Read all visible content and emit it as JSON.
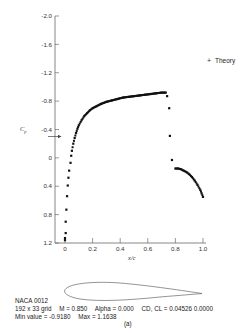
{
  "chart_data": {
    "type": "scatter",
    "title": "",
    "xlabel": "x/c",
    "ylabel": "Cp",
    "ylim": [
      1.2,
      -2.0
    ],
    "xlim": [
      0,
      1.0
    ],
    "y_inverted": true,
    "grid": false,
    "legend": {
      "position": "top-right",
      "entries": [
        {
          "marker": "+",
          "label": "Theory"
        }
      ]
    },
    "x_ticks": [
      "0",
      "0.2",
      "0.4",
      "0.6",
      "0.8",
      "1.0"
    ],
    "y_ticks": [
      "-2.0",
      "-1.6",
      "-1.2",
      "-0.8",
      "-0.4",
      "0",
      "0.4",
      "0.8",
      "1.2"
    ],
    "critical_cp_marker": {
      "value": -0.32,
      "label": "arrow on Cp axis"
    },
    "series": [
      {
        "name": "Theory",
        "marker": "square",
        "x": [
          0.0,
          0.0,
          0.005,
          0.005,
          0.01,
          0.015,
          0.02,
          0.025,
          0.03,
          0.04,
          0.045,
          0.05,
          0.06,
          0.07,
          0.08,
          0.09,
          0.1,
          0.12,
          0.14,
          0.16,
          0.18,
          0.2,
          0.23,
          0.26,
          0.3,
          0.34,
          0.38,
          0.42,
          0.46,
          0.5,
          0.54,
          0.58,
          0.62,
          0.66,
          0.7,
          0.73,
          0.74,
          0.755,
          0.76,
          0.775,
          0.8,
          0.82,
          0.84,
          0.86,
          0.88,
          0.9,
          0.92,
          0.94,
          0.96,
          0.98,
          0.99,
          1.0
        ],
        "values": [
          1.16,
          1.13,
          1.06,
          0.9,
          0.73,
          0.54,
          0.39,
          0.28,
          0.18,
          0.07,
          -0.03,
          -0.1,
          -0.2,
          -0.28,
          -0.35,
          -0.41,
          -0.46,
          -0.53,
          -0.59,
          -0.63,
          -0.67,
          -0.7,
          -0.73,
          -0.76,
          -0.79,
          -0.81,
          -0.83,
          -0.85,
          -0.86,
          -0.87,
          -0.88,
          -0.89,
          -0.9,
          -0.91,
          -0.92,
          -0.92,
          -0.87,
          -0.7,
          -0.31,
          0.03,
          0.15,
          0.15,
          0.16,
          0.18,
          0.2,
          0.23,
          0.27,
          0.32,
          0.38,
          0.45,
          0.5,
          0.55
        ]
      }
    ],
    "annotations": [
      "NACA 0012",
      "192 x 33 grid",
      "M = 0.850",
      "Alpha = 0.000",
      "CD, CL = 0.04526 0.0000",
      "Min value = -0.9180",
      "Max = 1.1638",
      "(a)"
    ]
  },
  "airfoil": {
    "name": "NACA 0012",
    "shape": "symmetric airfoil outline"
  },
  "caption": {
    "line1": "NACA 0012",
    "line2_grid": "192 x 33 grid",
    "line2_mach": "M = 0.850",
    "line2_alpha": "Alpha = 0.000",
    "line2_cdcl": "CD, CL = 0.04526  0.0000",
    "line3_min": "Min value = -0.9180",
    "line3_max": "Max = 1.1638",
    "panel_label": "(a)"
  },
  "legend_label": "Theory",
  "legend_marker": "+",
  "axis": {
    "ylabel_main": "C",
    "ylabel_sub": "p",
    "xlabel": "x/c"
  },
  "colors": {
    "ink": "#222222",
    "axis": "#555555",
    "background": "#ffffff"
  }
}
